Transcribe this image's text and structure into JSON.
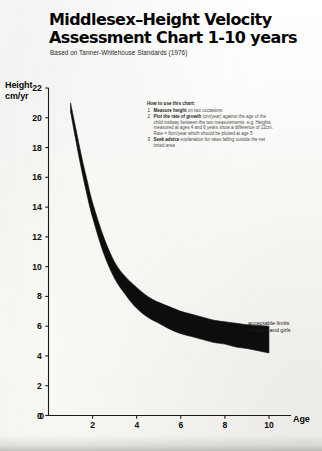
{
  "document": {
    "title_line1": "Middlesex–Height Velocity",
    "title_line2": "Assessment Chart 1-10 years",
    "subtitle": "Based on Tanner-Whitehouse Standards (1976)"
  },
  "instructions": {
    "heading": "How to use this chart:",
    "items": [
      {
        "number": "1",
        "bold": "Measure height",
        "rest": " on two occasions"
      },
      {
        "number": "2",
        "bold": "Plot the rate of growth",
        "rest": " (cm/year) against the age of the child midway between the two measurements. e.g. Heights measured at ages 4 and 6 years show a difference of 12cm. Rate = 6cm/year which should be plotted at age 5"
      },
      {
        "number": "3",
        "bold": "Seek advice",
        "rest": " explanation for rates falling outside the net tinted area"
      }
    ]
  },
  "axes": {
    "y_title_line1": "Height",
    "y_title_line2": "cm/yr",
    "x_title": "Age",
    "y_ticks": [
      22,
      20,
      18,
      16,
      14,
      12,
      10,
      8,
      6,
      4,
      2,
      0
    ],
    "x_ticks": [
      0,
      2,
      4,
      6,
      8,
      10
    ],
    "y_range": [
      0,
      22
    ],
    "x_range": [
      0,
      11
    ]
  },
  "annotation": {
    "line1": "acceptable limits",
    "line2": "for boys and girls"
  },
  "colors": {
    "ink": "#000000",
    "paper": "#fdfcfa",
    "band": "#0d0d0d"
  },
  "chart_data": {
    "type": "area",
    "title": "Middlesex–Height Velocity Assessment Chart 1-10 years",
    "subtitle": "Based on Tanner-Whitehouse Standards (1976)",
    "xlabel": "Age",
    "ylabel": "Height cm/yr",
    "xlim": [
      0,
      11
    ],
    "ylim": [
      0,
      22
    ],
    "grid": false,
    "legend": null,
    "annotations": [
      "acceptable limits for boys and girls"
    ],
    "x": [
      1.0,
      1.25,
      1.5,
      1.75,
      2.0,
      2.5,
      3.0,
      3.5,
      4.0,
      4.5,
      5.0,
      5.5,
      6.0,
      6.5,
      7.0,
      7.5,
      8.0,
      8.5,
      9.0,
      9.5,
      10.0
    ],
    "series": [
      {
        "name": "upper limit (97th centile)",
        "values": [
          21.0,
          19.2,
          17.4,
          15.8,
          14.3,
          12.0,
          10.3,
          9.3,
          8.6,
          8.0,
          7.6,
          7.3,
          7.0,
          6.8,
          6.6,
          6.4,
          6.3,
          6.2,
          6.1,
          6.05,
          6.0
        ]
      },
      {
        "name": "lower limit (3rd centile)",
        "values": [
          20.4,
          18.4,
          16.5,
          14.8,
          13.3,
          10.9,
          9.2,
          8.1,
          7.2,
          6.6,
          6.2,
          5.8,
          5.5,
          5.3,
          5.1,
          4.9,
          4.8,
          4.6,
          4.5,
          4.35,
          4.2
        ]
      }
    ]
  }
}
